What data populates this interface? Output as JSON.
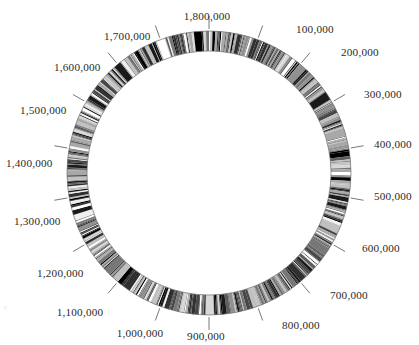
{
  "figure": {
    "background_color": "#ffffff",
    "label_color": "#2b2b2b",
    "tick_line_color": "#555555",
    "caption_fragment": "a"
  },
  "geometry": {
    "center_x": 209,
    "center_y": 173,
    "outer_radius": 142,
    "inner_radius": 122,
    "label_radius": 168,
    "tick_inner_radius": 144,
    "tick_outer_radius": 157
  },
  "chart_data": {
    "type": "circular-genome-ring",
    "xlabel": "Genome position (bp)",
    "ylabel": "",
    "units": "base pairs",
    "genome_length": 1800000,
    "axis_range": [
      0,
      1800000
    ],
    "tick_interval": 100000,
    "start_angle_deg": -90,
    "direction": "clockwise",
    "grid": false,
    "legend": "none",
    "tick_labels": [
      {
        "value": 100000,
        "text": "100,000",
        "angle_deg": 20,
        "x": 296,
        "y": 24,
        "align": "left"
      },
      {
        "value": 200000,
        "text": "200,000",
        "angle_deg": 40,
        "x": 341,
        "y": 47,
        "align": "left"
      },
      {
        "value": 300000,
        "text": "300,000",
        "angle_deg": 60,
        "x": 364,
        "y": 89,
        "align": "left"
      },
      {
        "value": 400000,
        "text": "400,000",
        "angle_deg": 80,
        "x": 374,
        "y": 139,
        "align": "left"
      },
      {
        "value": 500000,
        "text": "500,000",
        "angle_deg": 100,
        "x": 374,
        "y": 191,
        "align": "left"
      },
      {
        "value": 600000,
        "text": "600,000",
        "angle_deg": 120,
        "x": 362,
        "y": 243,
        "align": "left"
      },
      {
        "value": 700000,
        "text": "700,000",
        "angle_deg": 140,
        "x": 330,
        "y": 290,
        "align": "left"
      },
      {
        "value": 800000,
        "text": "800,000",
        "angle_deg": 160,
        "x": 282,
        "y": 320,
        "align": "left"
      },
      {
        "value": 900000,
        "text": "900,000",
        "angle_deg": 180,
        "x": 206,
        "y": 331,
        "align": "center"
      },
      {
        "value": 1000000,
        "text": "1,000,000",
        "angle_deg": 200,
        "x": 140,
        "y": 328,
        "align": "center"
      },
      {
        "value": 1100000,
        "text": "1,100,000",
        "angle_deg": 220,
        "x": 80,
        "y": 307,
        "align": "center"
      },
      {
        "value": 1200000,
        "text": "1,200,000",
        "angle_deg": 240,
        "x": 37,
        "y": 268,
        "align": "left"
      },
      {
        "value": 1300000,
        "text": "1,300,000",
        "angle_deg": 260,
        "x": 14,
        "y": 216,
        "align": "left"
      },
      {
        "value": 1400000,
        "text": "1,400,000",
        "angle_deg": 280,
        "x": 6,
        "y": 158,
        "align": "left"
      },
      {
        "value": 1500000,
        "text": "1,500,000",
        "angle_deg": 300,
        "x": 20,
        "y": 105,
        "align": "left"
      },
      {
        "value": 1600000,
        "text": "1,600,000",
        "angle_deg": 320,
        "x": 54,
        "y": 62,
        "align": "left"
      },
      {
        "value": 1700000,
        "text": "1,700,000",
        "angle_deg": 340,
        "x": 104,
        "y": 31,
        "align": "left"
      },
      {
        "value": 1800000,
        "text": "1,800,000",
        "angle_deg": 0,
        "x": 207,
        "y": 11,
        "align": "center"
      }
    ],
    "band_palette": [
      "#000000",
      "#1a1a1a",
      "#303030",
      "#474747",
      "#5e5e5e",
      "#777777",
      "#909090",
      "#a8a8a8",
      "#c0c0c0",
      "#d8d8d8",
      "#efefef",
      "#ffffff"
    ],
    "band_count": 620,
    "band_description": "Dense radial grayscale bands of varying width and intensity encircling the full 1,800,000 bp chromosome."
  }
}
